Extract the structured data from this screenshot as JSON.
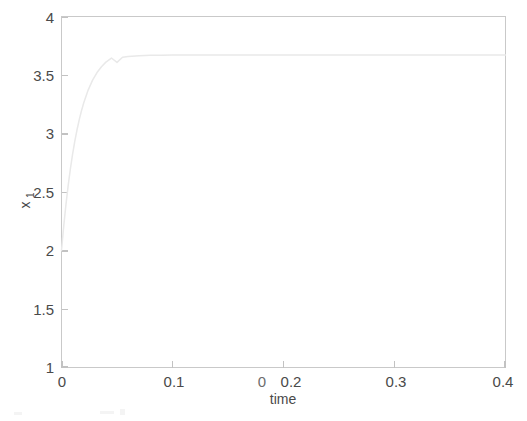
{
  "figure": {
    "background_color": "#ffffff",
    "axes_color": "#c9c9c9",
    "text_color": "#4a4a4a",
    "line_color": "#e9e9e9"
  },
  "chart_data": {
    "type": "line",
    "title": "",
    "xlabel": "time",
    "ylabel": "x_1",
    "ylabel_display": "x",
    "ylabel_subscript": "1",
    "xlim": [
      0,
      0.4
    ],
    "ylim": [
      1,
      4
    ],
    "grid": false,
    "legend": null,
    "xticks": [
      0,
      0.1,
      0.2,
      0.3,
      0.4
    ],
    "xticklabels": [
      "0",
      "0.1",
      "0.2",
      "0.3",
      "0.4"
    ],
    "yticks": [
      1,
      1.5,
      2,
      2.5,
      3,
      3.5,
      4
    ],
    "yticklabels": [
      "1",
      "1.5",
      "2",
      "2.5",
      "3",
      "3.5",
      "4"
    ],
    "annotations": [
      {
        "name": "scan-artifact-zero",
        "text": "0",
        "near": "0.2 tick label"
      }
    ],
    "series": [
      {
        "name": "x1",
        "initial_value": 2.0,
        "steady_state": 3.67,
        "time_constant": 0.015,
        "x": [
          0.0,
          0.002,
          0.004,
          0.006,
          0.008,
          0.01,
          0.012,
          0.014,
          0.016,
          0.018,
          0.02,
          0.024,
          0.028,
          0.032,
          0.036,
          0.04,
          0.045,
          0.05,
          0.055,
          0.06,
          0.07,
          0.08,
          0.09,
          0.1,
          0.12,
          0.14,
          0.16,
          0.18,
          0.2,
          0.24,
          0.28,
          0.32,
          0.36,
          0.4
        ],
        "values": [
          2.0,
          2.208,
          2.392,
          2.554,
          2.697,
          2.823,
          2.934,
          3.032,
          3.118,
          3.194,
          3.261,
          3.371,
          3.456,
          3.521,
          3.571,
          3.61,
          3.645,
          3.608,
          3.652,
          3.658,
          3.665,
          3.668,
          3.669,
          3.67,
          3.67,
          3.67,
          3.67,
          3.67,
          3.67,
          3.67,
          3.67,
          3.67,
          3.67,
          3.67
        ]
      }
    ]
  }
}
